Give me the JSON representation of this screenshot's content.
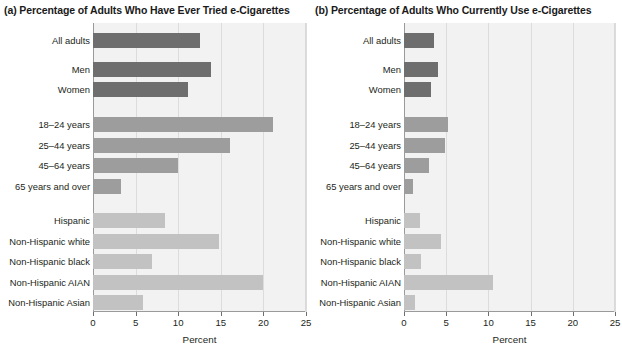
{
  "figure": {
    "axis_title": "Percent",
    "panel_a_title": "(a) Percentage of Adults Who Have Ever Tried e-Cigarettes",
    "panel_b_title": "(b) Percentage of Adults Who Currently Use e-Cigarettes",
    "colors": {
      "plot_background": "#f2f2f2",
      "gridline": "#dcdcdc",
      "axis": "#9a9a9a",
      "bar_dark": "#6e6e6e",
      "bar_mid": "#9d9d9d",
      "bar_light": "#c2c2c2",
      "text": "#231f20"
    }
  },
  "chart_data": [
    {
      "type": "bar",
      "orientation": "horizontal",
      "title": "(a) Percentage of Adults Who Have Ever Tried e-Cigarettes",
      "xlabel": "Percent",
      "ylabel": "",
      "xlim": [
        0,
        25
      ],
      "xticks": [
        0,
        5,
        10,
        15,
        20,
        25
      ],
      "xticklabels": [
        "0",
        "5",
        "10",
        "15",
        "20",
        "25"
      ],
      "grid": true,
      "legend": "none",
      "categories": [
        "All adults",
        "Men",
        "Women",
        "18–24 years",
        "25–44 years",
        "45–64 years",
        "65 years and over",
        "Hispanic",
        "Non-Hispanic white",
        "Non-Hispanic black",
        "Non-Hispanic AIAN",
        "Non-Hispanic Asian"
      ],
      "values": [
        12.6,
        13.9,
        11.2,
        21.1,
        16.1,
        10.0,
        3.3,
        8.5,
        14.8,
        6.9,
        19.9,
        5.9
      ],
      "group_shades": [
        "dark",
        "dark",
        "dark",
        "mid",
        "mid",
        "mid",
        "mid",
        "light",
        "light",
        "light",
        "light",
        "light"
      ]
    },
    {
      "type": "bar",
      "orientation": "horizontal",
      "title": "(b) Percentage of Adults Who Currently Use e-Cigarettes",
      "xlabel": "Percent",
      "ylabel": "",
      "xlim": [
        0,
        25
      ],
      "xticks": [
        0,
        5,
        10,
        15,
        20,
        25
      ],
      "xticklabels": [
        "0",
        "5",
        "10",
        "15",
        "20",
        "25"
      ],
      "grid": true,
      "legend": "none",
      "categories": [
        "All adults",
        "Men",
        "Women",
        "18–24 years",
        "25–44 years",
        "45–64 years",
        "65 years and over",
        "Hispanic",
        "Non-Hispanic white",
        "Non-Hispanic black",
        "Non-Hispanic AIAN",
        "Non-Hispanic Asian"
      ],
      "values": [
        3.6,
        4.0,
        3.2,
        5.2,
        4.9,
        3.0,
        1.1,
        1.9,
        4.4,
        2.0,
        10.5,
        1.3
      ],
      "group_shades": [
        "dark",
        "dark",
        "dark",
        "mid",
        "mid",
        "mid",
        "mid",
        "light",
        "light",
        "light",
        "light",
        "light"
      ]
    }
  ]
}
